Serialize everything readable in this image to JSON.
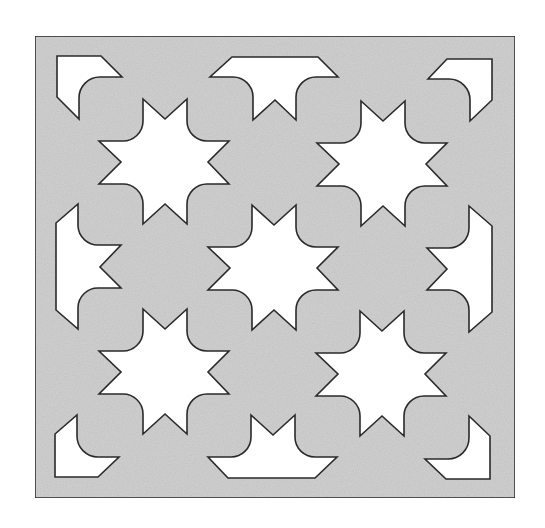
{
  "figure": {
    "width": 545,
    "height": 528,
    "colors": {
      "page_background": "#ffffff",
      "tile_fill": "#d3d3d3",
      "cutout_fill": "#ffffff",
      "stroke": "#2a2a2a"
    },
    "frame": {
      "x": 35,
      "y": 36,
      "width": 480,
      "height": 462
    },
    "stars": [
      {
        "name": "star-top-left",
        "cx": 165,
        "cy": 162
      },
      {
        "name": "star-top-right",
        "cx": 383,
        "cy": 164
      },
      {
        "name": "star-center",
        "cx": 274,
        "cy": 268
      },
      {
        "name": "star-bottom-left",
        "cx": 165,
        "cy": 372
      },
      {
        "name": "star-bottom-right",
        "cx": 382,
        "cy": 374
      }
    ],
    "edge_shapes": [
      {
        "name": "corner-cutout-top-left",
        "d": "M57 56 L101 56 L122 77 L100 77 A21 21 0 0 0 79 98 L79 119 L57 97 Z"
      },
      {
        "name": "edge-cutout-top-middle",
        "d": "M232 57 L318 57 L338 77 L316 77 A20 20 0 0 0 296 97 L296 120 L275 100 L253 120 L253 97 A20 20 0 0 0 233 77 L210 77 Z"
      },
      {
        "name": "corner-cutout-top-right",
        "d": "M447 59 L492 59 L492 100 L470 121 L470 100 A21 21 0 0 0 449 79 L428 79 Z"
      },
      {
        "name": "edge-cutout-left-middle",
        "d": "M78 204 L78 226 A20 20 0 0 0 99 245 L121 245 L100 267 L121 288 L99 288 A20 20 0 0 0 78 308 L78 329 L56 310 L56 223 Z"
      },
      {
        "name": "edge-cutout-right-middle",
        "d": "M469 206 L492 226 L492 312 L469 332 L469 310 A20 20 0 0 0 449 290 L427 290 L447 269 L427 248 L449 248 A20 20 0 0 0 469 228 Z"
      },
      {
        "name": "corner-cutout-bottom-left",
        "d": "M77 415 L77 436 A21 21 0 0 0 98 457 L119 457 L98 477 L55 477 L55 434 Z"
      },
      {
        "name": "edge-cutout-bottom-middle",
        "d": "M251 415 L273 435 L295 415 L295 437 A20 20 0 0 0 315 457 L337 457 L315 478 L228 478 L208 457 L231 457 A20 20 0 0 0 251 437 Z"
      },
      {
        "name": "corner-cutout-bottom-right",
        "d": "M469 416 L490 436 L490 479 L446 479 L425 459 L448 459 A21 21 0 0 0 469 438 Z"
      }
    ],
    "star_template": "M -22 -63 L 0 -43 L 22 -63 L 22 -41 A 20 20 0 0 0 42 -21 L 64 -21 L 43 0 L 64 22 L 42 22 A 20 20 0 0 0 22 42 L 22 62 L 0 42 L -22 62 L -22 42 A 20 20 0 0 0 -43 22 L -66 22 L -44 0 L -66 -21 L -43 -21 A 20 20 0 0 0 -22 -41 Z"
  }
}
